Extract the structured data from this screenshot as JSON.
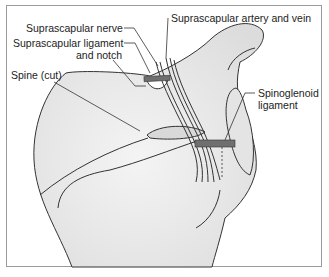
{
  "figure": {
    "labels": {
      "suprascapular_nerve": "Suprascapular nerve",
      "suprascapular_artery_vein": "Suprascapular artery and vein",
      "suprascapular_ligament_l1": "Suprascapular ligament",
      "suprascapular_ligament_l2": "and notch",
      "spine_cut": "Spine (cut)",
      "spinoglenoid_l1": "Spinoglenoid",
      "spinoglenoid_l2": "ligament"
    },
    "colors": {
      "bone_fill": "#ececec",
      "outline": "#333333",
      "ligament": "#6f6f6f",
      "border": "#9a9a9a"
    }
  }
}
